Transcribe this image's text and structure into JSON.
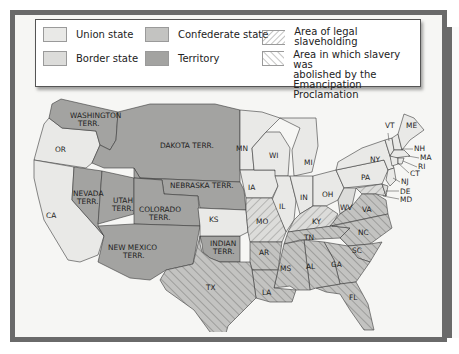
{
  "legend": {
    "items": [
      {
        "label": "Union state",
        "swatch": "union",
        "color": "#e9e9e7"
      },
      {
        "label": "Border state",
        "swatch": "border",
        "color": "#dcdcda"
      },
      {
        "label": "Confederate state",
        "swatch": "confederate",
        "color": "#c3c3c1"
      },
      {
        "label": "Territory",
        "swatch": "territory",
        "color": "#a3a3a1"
      },
      {
        "label": "Area of legal slaveholding",
        "swatch": "hatch-back"
      },
      {
        "label_lines": [
          "Area in which slavery was",
          "abolished by the",
          "Emancipation Proclamation"
        ],
        "swatch": "hatch-forward"
      }
    ]
  },
  "colors": {
    "frame": "#6a6a6a",
    "background": "#f6f6f4",
    "union": "#e9e9e7",
    "border": "#dcdcda",
    "confederate": "#c3c3c1",
    "territory": "#a3a3a1",
    "hatch": "#7d7d7b"
  },
  "map": {
    "territories": [
      "WASHINGTON TERR.",
      "DAKOTA TERR.",
      "NEBRASKA TERR.",
      "NEVADA TERR.",
      "UTAH TERR.",
      "COLORADO TERR.",
      "NEW MEXICO TERR.",
      "INDIAN TERR."
    ],
    "union_states": [
      "OR",
      "CA",
      "KS",
      "MN",
      "IA",
      "WI",
      "IL",
      "MI",
      "IN",
      "OH",
      "PA",
      "NY",
      "VT",
      "NH",
      "ME",
      "MA",
      "RI",
      "CT",
      "NJ"
    ],
    "border_states": [
      "MO",
      "KY",
      "WV",
      "DE",
      "MD"
    ],
    "confederate_states": [
      "TX",
      "AR",
      "LA",
      "MS",
      "AL",
      "TN",
      "GA",
      "FL",
      "SC",
      "NC",
      "VA"
    ],
    "labels": {
      "wa1": "WASHINGTON",
      "wa2": "TERR.",
      "dak": "DAKOTA TERR.",
      "or": "OR",
      "neb": "NEBRASKA TERR.",
      "nv1": "NEVADA",
      "nv2": "TERR.",
      "ut1": "UTAH",
      "ut2": "TERR.",
      "co1": "COLORADO",
      "co2": "TERR.",
      "ca": "CA",
      "ks": "KS",
      "nm1": "NEW MEXICO",
      "nm2": "TERR.",
      "in1": "INDIAN",
      "in2": "TERR.",
      "tx": "TX",
      "mn": "MN",
      "wi": "WI",
      "mi": "MI",
      "ia": "IA",
      "il": "IL",
      "ind": "IN",
      "oh": "OH",
      "pa": "PA",
      "ny": "NY",
      "vt": "VT",
      "me": "ME",
      "nh": "NH",
      "ma": "MA",
      "ri": "RI",
      "ct": "CT",
      "nj": "NJ",
      "de": "DE",
      "md": "MD",
      "mo": "MO",
      "ky": "KY",
      "wv": "WV",
      "va": "VA",
      "tn": "TN",
      "nc": "NC",
      "sc": "SC",
      "ar": "AR",
      "ms": "MS",
      "al": "AL",
      "ga": "GA",
      "la": "LA",
      "fl": "FL"
    }
  }
}
